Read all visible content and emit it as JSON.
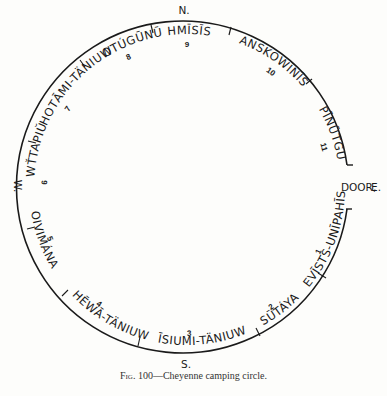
{
  "figure": {
    "caption_prefix": "Fig. 100",
    "caption_text": "—Cheyenne camping circle."
  },
  "directions": {
    "north": "N.",
    "south": "S.",
    "west": "W.",
    "east": "E.",
    "door": "DOOR,"
  },
  "bands": [
    {
      "number": "1",
      "name": "EVĪSTS-UNĪPAHĪS"
    },
    {
      "number": "2",
      "name": "SŪTÁYA"
    },
    {
      "number": "3",
      "name": "ĪSIUMI-TÄNIUW"
    },
    {
      "number": "4",
      "name": "HĒWĀ-TÄNIUW"
    },
    {
      "number": "5",
      "name": "OIVIMÁNA"
    },
    {
      "number": "6",
      "name": "WŤTAPIŬ"
    },
    {
      "number": "7",
      "name": "HOTĀMI-TÄNIUW"
    },
    {
      "number": "8",
      "name": "OTÚGŪNŪ"
    },
    {
      "number": "9",
      "name": "HMĪSĪS"
    },
    {
      "number": "10",
      "name": "ANSKOWĪNĪS"
    },
    {
      "number": "11",
      "name": "PĪNŪTGU"
    }
  ]
}
